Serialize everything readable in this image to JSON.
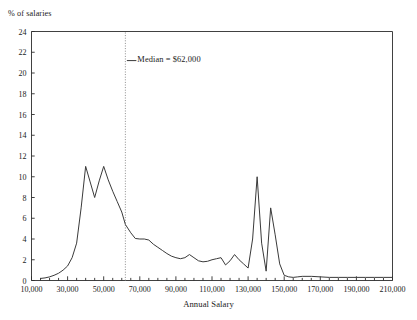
{
  "chart_data": {
    "type": "line",
    "title": "",
    "xlabel": "Annual Salary",
    "ylabel": "% of salaries",
    "xlim": [
      10000,
      210000
    ],
    "ylim": [
      0,
      24
    ],
    "grid": false,
    "legend_position": "none",
    "x_major_step": 20000,
    "x_minor_step": 5000,
    "y_tick_step": 2,
    "xticks": [
      "10,000",
      "30,000",
      "50,000",
      "70,000",
      "90,000",
      "110,000",
      "130,000",
      "150,000",
      "170,000",
      "190,000",
      "210,000"
    ],
    "xtick_values": [
      10000,
      30000,
      50000,
      70000,
      90000,
      110000,
      130000,
      150000,
      170000,
      190000,
      210000
    ],
    "yticks": [
      "0",
      "2",
      "4",
      "6",
      "8",
      "10",
      "12",
      "14",
      "16",
      "18",
      "20",
      "22",
      "24"
    ],
    "ytick_values": [
      0,
      2,
      4,
      6,
      8,
      10,
      12,
      14,
      16,
      18,
      20,
      22,
      24
    ],
    "annotations": [
      {
        "name": "median-marker",
        "label": "Median = $62,000",
        "value": 62000,
        "style": "dotted-vertical-line",
        "label_x": 67000,
        "label_y": 21.2
      }
    ],
    "series": [
      {
        "name": "Salary distribution",
        "color": "#3a3a3a",
        "x": [
          15000,
          17500,
          20000,
          22500,
          25000,
          27500,
          30000,
          32500,
          35000,
          37500,
          40000,
          42500,
          45000,
          47500,
          50000,
          52500,
          55000,
          57500,
          60000,
          62000,
          65000,
          67500,
          70000,
          72500,
          75000,
          77500,
          80000,
          82500,
          85000,
          87500,
          90000,
          92500,
          95000,
          97500,
          100000,
          102500,
          105000,
          107500,
          110000,
          112500,
          115000,
          117500,
          120000,
          122500,
          125000,
          127500,
          130000,
          132500,
          135000,
          137500,
          140000,
          142500,
          145000,
          147500,
          150000,
          152500,
          155000,
          157500,
          160000,
          165000,
          170000,
          175000,
          180000,
          185000,
          190000,
          195000,
          200000,
          205000,
          210000
        ],
        "y": [
          0.2,
          0.25,
          0.35,
          0.5,
          0.7,
          1.0,
          1.4,
          2.2,
          3.6,
          7.0,
          11.0,
          9.5,
          8.0,
          9.6,
          11.0,
          9.7,
          8.6,
          7.6,
          6.6,
          5.4,
          4.6,
          4.05,
          4.0,
          4.0,
          3.9,
          3.5,
          3.2,
          2.9,
          2.6,
          2.35,
          2.2,
          2.1,
          2.2,
          2.5,
          2.2,
          1.9,
          1.8,
          1.85,
          2.0,
          2.1,
          2.2,
          1.5,
          1.9,
          2.5,
          2.0,
          1.6,
          1.2,
          4.0,
          10.0,
          3.6,
          0.9,
          7.0,
          4.4,
          1.6,
          0.5,
          0.35,
          0.3,
          0.35,
          0.4,
          0.4,
          0.35,
          0.3,
          0.3,
          0.3,
          0.3,
          0.3,
          0.3,
          0.3,
          0.3
        ]
      }
    ]
  },
  "colors": {
    "axis": "#2b2b2b",
    "line": "#3a3a3a",
    "median": "#8c8c8c",
    "text": "#1a1a1a",
    "background": "#ffffff"
  }
}
